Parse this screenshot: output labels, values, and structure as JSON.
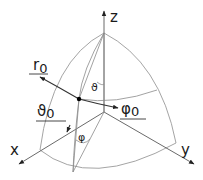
{
  "diagram": {
    "colors": {
      "line": "#9a9a9a",
      "axis": "#6a6a6a",
      "text": "#1a1a1a",
      "point": "#000000"
    },
    "axes": {
      "z": {
        "label": "z"
      },
      "x": {
        "label": "x"
      },
      "y": {
        "label": "y"
      }
    },
    "unit_vectors": {
      "r0": {
        "symbol": "r",
        "subscript": "0"
      },
      "theta0": {
        "symbol": "ϑ",
        "subscript": "0"
      },
      "phi0": {
        "symbol": "φ",
        "subscript": "0"
      }
    },
    "angles": {
      "theta": "ϑ",
      "phi": "φ"
    }
  }
}
